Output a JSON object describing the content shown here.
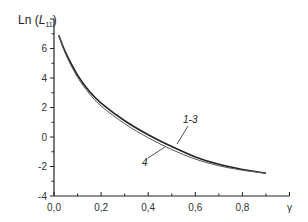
{
  "chart_data": {
    "type": "line",
    "title": "",
    "xlabel": "γ",
    "ylabel": "Ln (L11)",
    "ylabel_parts": {
      "prefix": "Ln (",
      "var": "L",
      "sub": "11",
      "suffix": ")"
    },
    "xlim": [
      0.0,
      1.0
    ],
    "ylim": [
      -4,
      8
    ],
    "x_ticks": [
      0.0,
      0.2,
      0.4,
      0.6,
      0.8
    ],
    "x_tick_labels": [
      "0,0",
      "0,2",
      "0,4",
      "0,6",
      "0,8"
    ],
    "y_ticks": [
      -4,
      -2,
      0,
      2,
      4,
      6
    ],
    "y_tick_labels": [
      "-4",
      "-2",
      "0",
      "2",
      "4",
      "6"
    ],
    "grid": false,
    "legend": "inline curve labels",
    "series": [
      {
        "name": "1-3",
        "color": "#222222",
        "x": [
          0.02,
          0.05,
          0.1,
          0.15,
          0.2,
          0.3,
          0.4,
          0.5,
          0.6,
          0.7,
          0.8,
          0.9
        ],
        "y": [
          6.9,
          5.7,
          4.2,
          3.1,
          2.3,
          1.1,
          0.15,
          -0.65,
          -1.35,
          -1.85,
          -2.2,
          -2.45
        ]
      },
      {
        "name": "4",
        "color": "#555555",
        "x": [
          0.02,
          0.05,
          0.1,
          0.15,
          0.2,
          0.3,
          0.4,
          0.5,
          0.6,
          0.7,
          0.8,
          0.9
        ],
        "y": [
          6.9,
          5.6,
          4.05,
          2.95,
          2.1,
          0.9,
          -0.05,
          -0.85,
          -1.5,
          -1.95,
          -2.25,
          -2.45
        ]
      }
    ],
    "annotations": [
      {
        "text": "1-3",
        "x": 0.58,
        "y": 0.9
      },
      {
        "text": "4",
        "x": 0.38,
        "y": -1.7
      }
    ]
  }
}
